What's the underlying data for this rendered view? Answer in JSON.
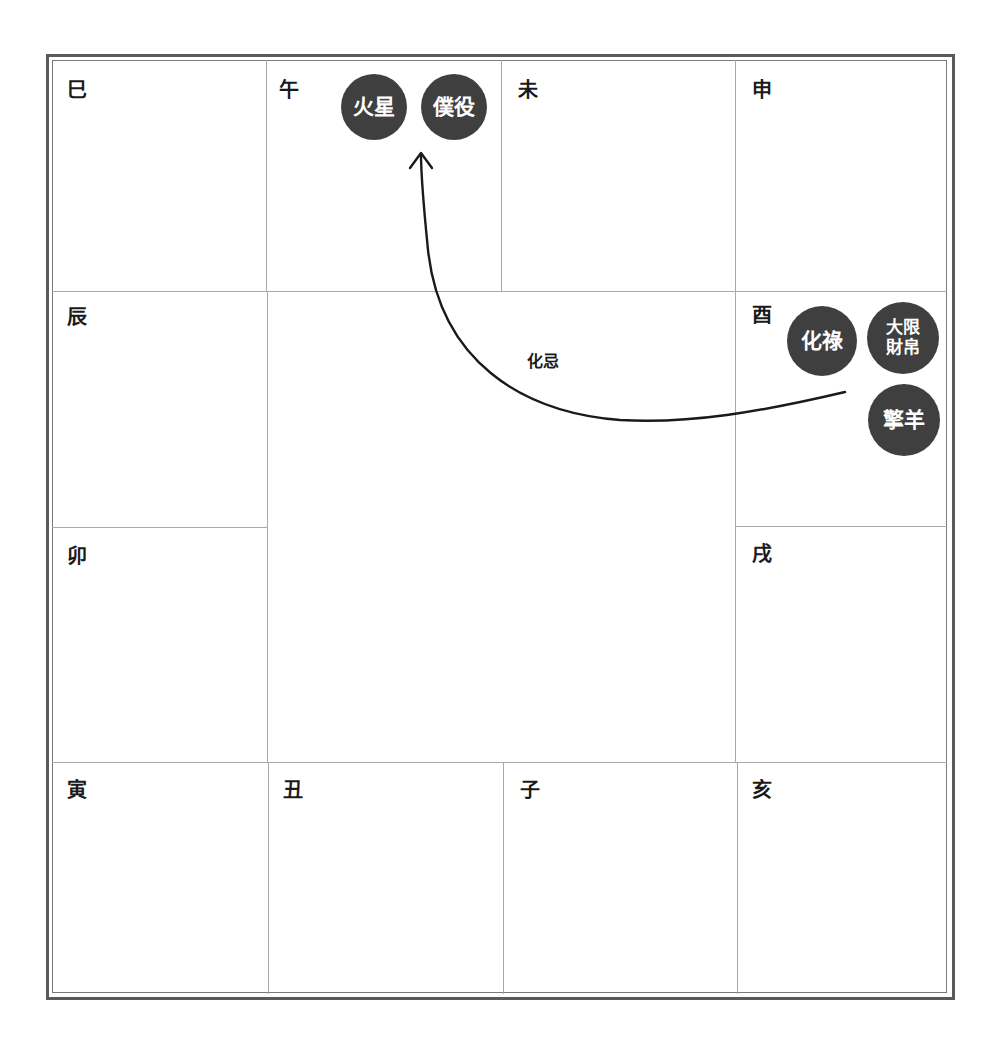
{
  "chart": {
    "type": "ziwei-doushu-12-palace-grid",
    "palaces": {
      "si": "巳",
      "wu": "午",
      "wei": "未",
      "shen": "申",
      "chen": "辰",
      "you": "酉",
      "mao": "卯",
      "xu": "戌",
      "yin": "寅",
      "chou": "丑",
      "zi": "子",
      "hai": "亥"
    },
    "badges": {
      "wu": [
        {
          "label": "火星"
        },
        {
          "label": "僕役"
        }
      ],
      "you": [
        {
          "label": "化祿"
        },
        {
          "line1": "大限",
          "line2": "財帛"
        },
        {
          "label": "擎羊"
        }
      ]
    },
    "arrow": {
      "label": "化忌",
      "from_palace": "酉",
      "to_palace": "午"
    },
    "colors": {
      "badge_fill": "#3f3f3f",
      "badge_text": "#ffffff",
      "grid_line": "#a8a8a8",
      "frame": "#5a5a5a",
      "arrow": "#1a1a1a"
    }
  }
}
